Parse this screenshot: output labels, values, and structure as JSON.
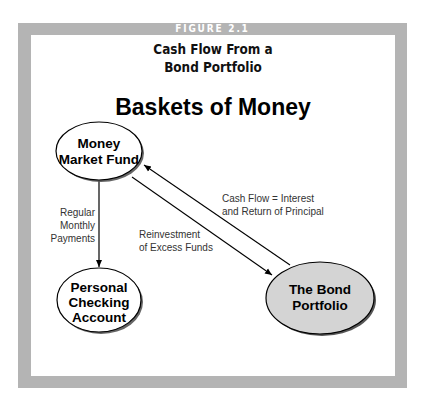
{
  "figure": {
    "label": "FIGURE 2.1",
    "title_lines": [
      "Cash Flow From a",
      "Bond Portfolio"
    ],
    "subtitle": "Baskets of Money"
  },
  "colors": {
    "frame": "#b4b4b4",
    "panel": "#ffffff",
    "bond_fill": "#d4d4d4",
    "node_fill": "#ffffff",
    "stroke": "#000000"
  },
  "nodes": {
    "money_market": {
      "lines": [
        "Money",
        "Market Fund"
      ]
    },
    "checking": {
      "lines": [
        "Personal",
        "Checking",
        "Account"
      ]
    },
    "bond": {
      "lines": [
        "The Bond",
        "Portfolio"
      ]
    }
  },
  "edges": {
    "payments": {
      "lines": [
        "Regular",
        "Monthly",
        "Payments"
      ],
      "from": "Money Market Fund",
      "to": "Personal Checking Account"
    },
    "cash_flow": {
      "lines": [
        "Cash Flow = Interest",
        "and Return of Principal"
      ],
      "from": "The Bond Portfolio",
      "to": "Money Market Fund"
    },
    "reinvestment": {
      "lines": [
        "Reinvestment",
        "of Excess Funds"
      ],
      "from": "Money Market Fund",
      "to": "The Bond Portfolio"
    }
  }
}
